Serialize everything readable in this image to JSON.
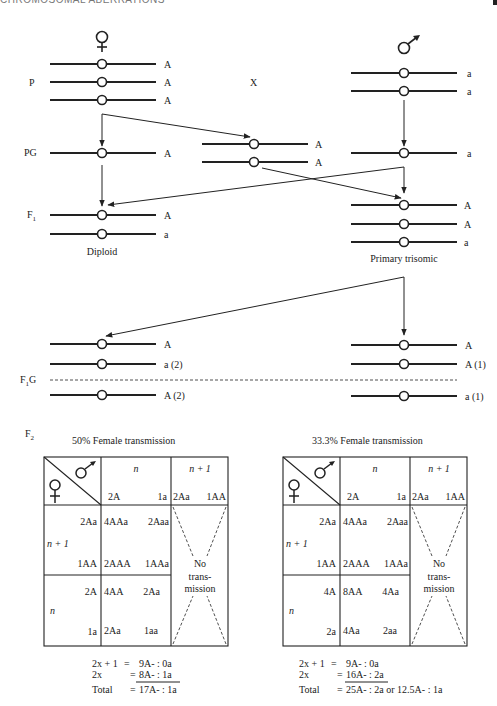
{
  "header": {
    "running_title": "CHROMOSOMAL ABERRATIONS"
  },
  "symbols": {
    "female": "♀",
    "male": "♂",
    "cross": "X"
  },
  "generations": {
    "P": "P",
    "PG": "PG",
    "F1": "F",
    "F1_sub": "1",
    "F1G": "F",
    "F1G_sub": "1",
    "F1G_suffix": "G",
    "F2": "F",
    "F2_sub": "2"
  },
  "parents": {
    "female": {
      "alleles": [
        "A",
        "A",
        "A"
      ]
    },
    "male": {
      "alleles": [
        "a",
        "a"
      ]
    }
  },
  "gametes_PG": {
    "female_haploid": [
      "A"
    ],
    "female_disomic": [
      "A",
      "A"
    ],
    "male_haploid": [
      "a"
    ]
  },
  "F1": {
    "diploid": {
      "alleles": [
        "A",
        "a"
      ],
      "caption": "Diploid"
    },
    "trisomic": {
      "alleles": [
        "A",
        "A",
        "a"
      ],
      "caption": "Primary trisomic"
    }
  },
  "F1G": {
    "left": {
      "above": [
        "A",
        "a (2)"
      ],
      "below": [
        "A (2)"
      ]
    },
    "right": {
      "above": [
        "A",
        "A (1)"
      ],
      "below": [
        "a (1)"
      ]
    }
  },
  "tables": [
    {
      "title": "50% Female transmission",
      "col_headers": [
        {
          "label": "n",
          "gametes": [
            "2A",
            "1a"
          ]
        },
        {
          "label": "n + 1",
          "gametes": [
            "2Aa",
            "1AA"
          ]
        }
      ],
      "rows": [
        {
          "label": "n + 1",
          "gametes": [
            "2Aa",
            "1AA"
          ],
          "cells": [
            [
              "4AAa",
              "2Aaa"
            ],
            [
              "2AAA",
              "1AAa"
            ]
          ]
        },
        {
          "label": "n",
          "gametes": [
            "2A",
            "1a"
          ],
          "cells": [
            [
              "4AA",
              "2Aa"
            ],
            [
              "2Aa",
              "1aa"
            ]
          ]
        }
      ],
      "no_transmission": [
        "No",
        "trans-",
        "mission"
      ],
      "summary": [
        {
          "term": "2x + 1",
          "eq": "=",
          "value": "9A- : 0a"
        },
        {
          "term": "2x",
          "eq": "=",
          "value": "8A- : 1a"
        },
        {
          "term": "Total",
          "eq": "=",
          "value": "17A- : 1a"
        }
      ]
    },
    {
      "title": "33.3% Female transmission",
      "col_headers": [
        {
          "label": "n",
          "gametes": [
            "2A",
            "1a"
          ]
        },
        {
          "label": "n + 1",
          "gametes": [
            "2Aa",
            "1AA"
          ]
        }
      ],
      "rows": [
        {
          "label": "n + 1",
          "gametes": [
            "2Aa",
            "1AA"
          ],
          "cells": [
            [
              "4AAa",
              "2Aaa"
            ],
            [
              "2AAA",
              "1AAa"
            ]
          ]
        },
        {
          "label": "n",
          "gametes": [
            "4A",
            "2a"
          ],
          "cells": [
            [
              "8AA",
              "4Aa"
            ],
            [
              "4Aa",
              "2aa"
            ]
          ]
        }
      ],
      "no_transmission": [
        "No",
        "trans-",
        "mission"
      ],
      "summary": [
        {
          "term": "2x + 1",
          "eq": "=",
          "value": "9A- : 0a"
        },
        {
          "term": "2x",
          "eq": "=",
          "value": "16A- : 2a"
        },
        {
          "term": "Total",
          "eq": "=",
          "value": "25A- : 2a or 12.5A- : 1a"
        }
      ]
    }
  ]
}
